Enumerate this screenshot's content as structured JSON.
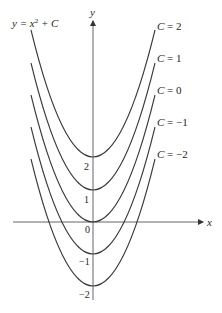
{
  "chart_data": {
    "type": "line",
    "xlabel": "x",
    "ylabel": "y",
    "x_range": [
      -1.95,
      1.95
    ],
    "ylim": [
      -2.2,
      4.1
    ],
    "grid": false,
    "legend_position": "inline-right",
    "y_ticks": [
      {
        "value": 2,
        "label": "2"
      },
      {
        "value": 1,
        "label": "1"
      },
      {
        "value": 0,
        "label": "0"
      },
      {
        "value": -1,
        "label": "−1"
      },
      {
        "value": -2,
        "label": "−2"
      }
    ],
    "series": [
      {
        "name": "C = 2",
        "C": 2,
        "x": [
          -1.95,
          -1,
          0,
          1,
          1.95
        ],
        "values": [
          5.8,
          3,
          2,
          3,
          5.8
        ]
      },
      {
        "name": "C = 1",
        "C": 1,
        "x": [
          -1.95,
          -1,
          0,
          1,
          1.95
        ],
        "values": [
          4.8,
          2,
          1,
          2,
          4.8
        ]
      },
      {
        "name": "C = 0",
        "C": 0,
        "x": [
          -1.95,
          -1,
          0,
          1,
          1.95
        ],
        "values": [
          3.8,
          1,
          0,
          1,
          3.8
        ]
      },
      {
        "name": "C = −1",
        "C": -1,
        "x": [
          -1.95,
          -1,
          0,
          1,
          1.95
        ],
        "values": [
          2.8,
          0,
          -1,
          0,
          2.8
        ]
      },
      {
        "name": "C = −2",
        "C": -2,
        "x": [
          -1.95,
          -1,
          0,
          1,
          1.95
        ],
        "values": [
          1.8,
          -1,
          -2,
          -1,
          1.8
        ]
      }
    ]
  },
  "labels": {
    "equation_lhs": "y = x",
    "equation_exp": "2",
    "equation_rhs": " + C",
    "x_axis": "x",
    "y_axis": "y",
    "tick_2": "2",
    "tick_1": "1",
    "tick_0": "0",
    "tick_m1": "−1",
    "tick_m2": "−2",
    "curve_c2": "C = 2",
    "curve_c1": "C = 1",
    "curve_c0": "C = 0",
    "curve_cm1": "C = −1",
    "curve_cm2": "C = −2"
  }
}
